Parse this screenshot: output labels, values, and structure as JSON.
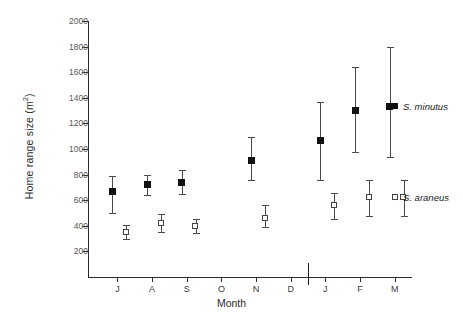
{
  "chart_data": {
    "type": "scatter",
    "title": "",
    "xlabel": "Month",
    "ylabel": "Home range size (m2)",
    "ylabel_display": "Home range size (m²)",
    "ylim": [
      0,
      2000
    ],
    "ytick_values": [
      200,
      400,
      600,
      800,
      1000,
      1200,
      1400,
      1600,
      1800,
      2000
    ],
    "ytick_labels": [
      "200",
      "400",
      "600",
      "800",
      "1000",
      "1200",
      "1400",
      "1600",
      "1800",
      "2000"
    ],
    "grid": false,
    "legend_position": "right-inside",
    "error_bars": "vertical, mean with capped range",
    "year_break_after_category": "D",
    "categories": [
      "J",
      "A",
      "S",
      "O",
      "N",
      "D",
      "J",
      "F",
      "M"
    ],
    "series": [
      {
        "name": "S. minutus",
        "marker": "filled-square",
        "color": "#111111",
        "points": [
          {
            "category": "J",
            "value": 665,
            "low": 500,
            "high": 790
          },
          {
            "category": "A",
            "value": 720,
            "low": 640,
            "high": 800
          },
          {
            "category": "S",
            "value": 740,
            "low": 650,
            "high": 835
          },
          {
            "category": "O",
            "value": null,
            "low": null,
            "high": null
          },
          {
            "category": "N",
            "value": 910,
            "low": 760,
            "high": 1095
          },
          {
            "category": "D",
            "value": null,
            "low": null,
            "high": null
          },
          {
            "category": "J",
            "value": 1065,
            "low": 760,
            "high": 1370
          },
          {
            "category": "F",
            "value": 1300,
            "low": 975,
            "high": 1640
          },
          {
            "category": "M",
            "value": 1330,
            "low": 940,
            "high": 1800
          }
        ]
      },
      {
        "name": "S. araneus",
        "marker": "open-square",
        "color": "#444444",
        "points": [
          {
            "category": "J",
            "value": 350,
            "low": 295,
            "high": 410
          },
          {
            "category": "A",
            "value": 420,
            "low": 355,
            "high": 495
          },
          {
            "category": "S",
            "value": 395,
            "low": 345,
            "high": 455
          },
          {
            "category": "O",
            "value": null,
            "low": null,
            "high": null
          },
          {
            "category": "N",
            "value": 460,
            "low": 390,
            "high": 560
          },
          {
            "category": "D",
            "value": null,
            "low": null,
            "high": null
          },
          {
            "category": "J",
            "value": 560,
            "low": 450,
            "high": 660
          },
          {
            "category": "F",
            "value": 620,
            "low": 480,
            "high": 755
          },
          {
            "category": "M",
            "value": 620,
            "low": 480,
            "high": 755
          }
        ]
      }
    ],
    "legend": [
      {
        "label": "S. minutus",
        "marker": "filled-square"
      },
      {
        "label": "S. araneus",
        "marker": "open-square"
      }
    ]
  }
}
